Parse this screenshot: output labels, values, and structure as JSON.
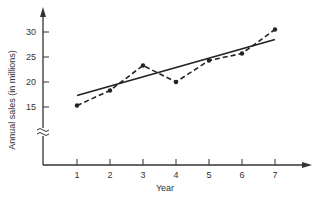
{
  "chart_data": {
    "type": "line",
    "title": "",
    "xlabel": "Year",
    "ylabel": "Annual sales (in millions)",
    "x": [
      1,
      2,
      3,
      4,
      5,
      6,
      7
    ],
    "x_tick_labels": [
      "1",
      "2",
      "3",
      "4",
      "5",
      "6",
      "7"
    ],
    "y_tick_labels": [
      "15",
      "20",
      "25",
      "30"
    ],
    "y_ticks": [
      15,
      20,
      25,
      30
    ],
    "ylim": [
      10,
      32
    ],
    "y_axis_break": true,
    "grid": false,
    "legend": null,
    "series": [
      {
        "name": "Actual sales",
        "style": "dashed-with-markers",
        "values": [
          15.3,
          18.3,
          23.3,
          20.0,
          24.3,
          25.7,
          30.5
        ]
      },
      {
        "name": "Trend line",
        "style": "solid",
        "values": [
          17.3,
          19.2,
          21.0,
          22.9,
          24.8,
          26.6,
          28.5
        ]
      }
    ]
  },
  "colors": {
    "ink": "#222222",
    "axis": "#333333"
  }
}
